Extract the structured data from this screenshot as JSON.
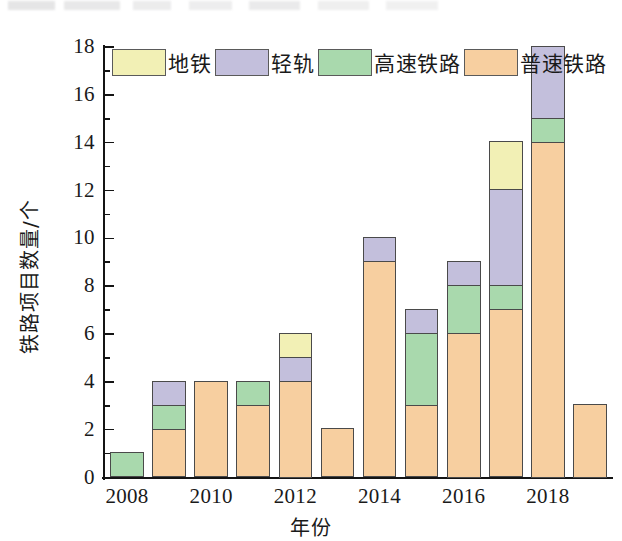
{
  "chart_data": {
    "type": "bar",
    "stacked": true,
    "title": "",
    "xlabel": "年份",
    "ylabel": "铁路项目数量/个",
    "categories": [
      "2008",
      "2009",
      "2010",
      "2011",
      "2012",
      "2013",
      "2014",
      "2015",
      "2016",
      "2017",
      "2018",
      "2019"
    ],
    "xtick_labels": [
      "2008",
      "2010",
      "2012",
      "2014",
      "2016",
      "2018"
    ],
    "ytick_labels": [
      "0",
      "2",
      "4",
      "6",
      "8",
      "10",
      "12",
      "14",
      "16",
      "18"
    ],
    "ylim": [
      0,
      18
    ],
    "ytick_step": 2,
    "minor_ticks": true,
    "grid": false,
    "legend_position": "top-left-inside",
    "series": [
      {
        "name": "普速铁路",
        "color": "#f7cfa0",
        "values": [
          0,
          2,
          4,
          3,
          4,
          2,
          9,
          3,
          6,
          7,
          14,
          3
        ]
      },
      {
        "name": "高速铁路",
        "color": "#a9d9ad",
        "values": [
          1,
          1,
          0,
          1,
          0,
          0,
          0,
          3,
          2,
          1,
          1,
          0
        ]
      },
      {
        "name": "轻轨",
        "color": "#c3bfdc",
        "values": [
          0,
          1,
          0,
          0,
          1,
          0,
          1,
          1,
          1,
          4,
          3,
          0
        ]
      },
      {
        "name": "地铁",
        "color": "#f2f0b5",
        "values": [
          0,
          0,
          0,
          0,
          1,
          0,
          0,
          0,
          0,
          2,
          0,
          0
        ]
      }
    ],
    "totals": [
      1,
      4,
      4,
      4,
      6,
      2,
      10,
      7,
      9,
      14,
      18,
      3
    ]
  },
  "legend": {
    "items": [
      {
        "label": "地铁",
        "color": "#f2f0b5"
      },
      {
        "label": "轻轨",
        "color": "#c3bfdc"
      },
      {
        "label": "高速铁路",
        "color": "#a9d9ad"
      },
      {
        "label": "普速铁路",
        "color": "#f7cfa0"
      }
    ]
  },
  "axes": {
    "x_title": "年份",
    "y_title": "铁路项目数量/个"
  }
}
